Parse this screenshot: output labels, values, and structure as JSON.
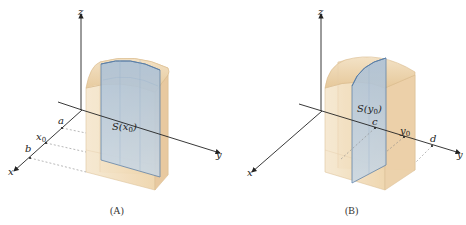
{
  "panels": [
    {
      "id": "A",
      "caption": "(A)",
      "axes": {
        "x": "x",
        "y": "y",
        "z": "z"
      },
      "x_axis_ticks": [
        "a",
        "x0",
        "b"
      ],
      "x_axis_tick_labels": {
        "a": "a",
        "x0_base": "x",
        "x0_sub": "0",
        "b": "b"
      },
      "slice_label_base": "S(x",
      "slice_label_sub": "0",
      "slice_label_close": ")",
      "slice_orientation": "perpendicular to x-axis"
    },
    {
      "id": "B",
      "caption": "(B)",
      "axes": {
        "x": "x",
        "y": "y",
        "z": "z"
      },
      "y_axis_ticks": [
        "c",
        "y0",
        "d"
      ],
      "y_axis_tick_labels": {
        "c": "c",
        "y0_base": "y",
        "y0_sub": "0",
        "d": "d"
      },
      "slice_label_base": "S(y",
      "slice_label_sub": "0",
      "slice_label_close": ")",
      "slice_orientation": "perpendicular to y-axis"
    }
  ],
  "colors": {
    "solid_fill": "#f1dcb8",
    "solid_edge": "#d8b88a",
    "slice_fill": "#b9cde0",
    "slice_edge": "#5a7fa8",
    "axis": "#222222",
    "dashed": "#888888"
  }
}
